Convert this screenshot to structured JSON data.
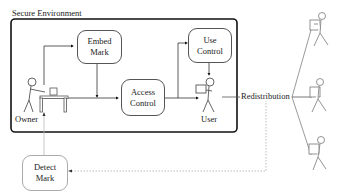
{
  "diagram": {
    "container_title": "Secure Environment",
    "nodes": {
      "embed_mark": "Embed\nMark",
      "access_control": "Access\nControl",
      "use_control": "Use\nControl",
      "detect_mark": "Detect\nMark"
    },
    "actors": {
      "owner": "Owner",
      "user": "User",
      "recipients_count": 3
    },
    "edges": {
      "redistribution": "Redistribution"
    }
  }
}
